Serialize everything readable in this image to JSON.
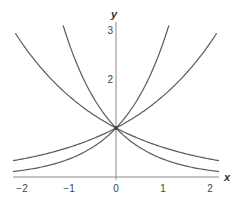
{
  "chart_data": {
    "type": "line",
    "title": "",
    "xlabel": "x",
    "ylabel": "y",
    "xlim": [
      -2.2,
      2.2
    ],
    "ylim": [
      0,
      3.1
    ],
    "grid": false,
    "legend": null,
    "x_ticks": [
      -2,
      -1,
      0,
      1,
      2
    ],
    "x_tick_labels": [
      "−2",
      "−1",
      "0",
      "1",
      "2"
    ],
    "y_ticks": [
      2,
      3
    ],
    "y_tick_labels": [
      "2",
      "3"
    ],
    "series": [
      {
        "name": "e^x",
        "base": 2.71828,
        "x": [
          -2.2,
          -2,
          -1,
          0,
          1,
          1.13
        ],
        "values": [
          0.11,
          0.14,
          0.37,
          1,
          2.72,
          3.1
        ]
      },
      {
        "name": "e^-x",
        "base": 0.36788,
        "x": [
          -1.13,
          -1,
          0,
          1,
          2,
          2.2
        ],
        "values": [
          3.1,
          2.72,
          1,
          0.37,
          0.14,
          0.11
        ]
      },
      {
        "name": "e^(x/2)",
        "base": 1.64872,
        "x": [
          -2.2,
          -2,
          -1,
          0,
          1,
          2,
          2.15
        ],
        "values": [
          0.33,
          0.37,
          0.61,
          1,
          1.65,
          2.72,
          2.93
        ]
      },
      {
        "name": "e^(-x/2)",
        "base": 0.60653,
        "x": [
          -2.15,
          -2,
          -1,
          0,
          1,
          2,
          2.2
        ],
        "values": [
          2.93,
          2.72,
          1.65,
          1,
          0.61,
          0.37,
          0.33
        ]
      }
    ],
    "annotations": [
      {
        "text": "(0, 1) common intersection point"
      }
    ]
  },
  "labels": {
    "x_axis": "x",
    "y_axis": "y",
    "x_ticks": [
      "−2",
      "−1",
      "0",
      "1",
      "2"
    ],
    "y_ticks": [
      "2",
      "3"
    ]
  },
  "colors": {
    "curve": "#5a5a5a",
    "axis": "#8a8a8a"
  }
}
